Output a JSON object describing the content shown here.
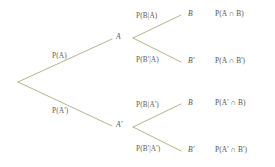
{
  "diagram": {
    "type": "probability-tree",
    "title": "",
    "background_color": "#ffffff",
    "line_color": "#b5b58a",
    "text_color": "#5f5f58",
    "root": {
      "label": ""
    },
    "stage1": [
      {
        "branch_label": "P(A)",
        "node_label": "A"
      },
      {
        "branch_label": "P(A')",
        "node_label": "A'"
      }
    ],
    "stage2": [
      {
        "branch_label": "P(B|A)",
        "node_label": "B",
        "outcome": "P(A ∩ B)"
      },
      {
        "branch_label": "P(B'|A)",
        "node_label": "B'",
        "outcome": "P(A ∩ B')"
      },
      {
        "branch_label": "P(B|A')",
        "node_label": "B",
        "outcome": "P(A' ∩ B)"
      },
      {
        "branch_label": "P(B'|A')",
        "node_label": "B'",
        "outcome": "P(A' ∩ B')"
      }
    ]
  }
}
